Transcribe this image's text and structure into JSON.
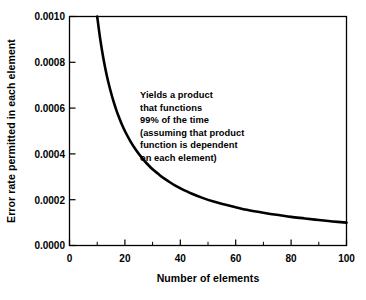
{
  "chart_data": {
    "type": "line",
    "title": "",
    "subtitle": "",
    "xlabel": "Number of elements",
    "ylabel": "Error rate permitted in each element",
    "xlim": [
      0,
      100
    ],
    "ylim": [
      0.0,
      0.001
    ],
    "grid": false,
    "legend": null,
    "x_ticks": [
      0,
      20,
      40,
      60,
      80,
      100
    ],
    "x_tick_labels": [
      "0",
      "20",
      "40",
      "60",
      "80",
      "100"
    ],
    "x_minor_ticks": [
      10,
      30,
      50,
      70,
      90
    ],
    "y_ticks": [
      0.0,
      0.0002,
      0.0004,
      0.0006,
      0.0008,
      0.001
    ],
    "y_tick_labels": [
      "0.0000",
      "0.0002",
      "0.0004",
      "0.0006",
      "0.0008",
      "0.0010"
    ],
    "series": [
      {
        "name": "Error rate per element",
        "relation": "y = 0.01 / x",
        "color": "#000000",
        "line_width": 2.6,
        "x": [
          10,
          11,
          12,
          13,
          14,
          15,
          16,
          17,
          18,
          19,
          20,
          22,
          24,
          26,
          28,
          30,
          32,
          34,
          36,
          38,
          40,
          44,
          48,
          52,
          56,
          60,
          64,
          68,
          72,
          76,
          80,
          85,
          90,
          95,
          100
        ],
        "values": [
          0.001,
          0.000909,
          0.000833,
          0.000769,
          0.000714,
          0.000667,
          0.000625,
          0.000588,
          0.000556,
          0.000526,
          0.0005,
          0.000455,
          0.000417,
          0.000385,
          0.000357,
          0.000333,
          0.000313,
          0.000294,
          0.000278,
          0.000263,
          0.00025,
          0.000227,
          0.000208,
          0.000192,
          0.000179,
          0.000167,
          0.000156,
          0.000147,
          0.000139,
          0.000132,
          0.000125,
          0.000118,
          0.000111,
          0.000105,
          0.0001
        ]
      }
    ],
    "annotations": [
      {
        "name": "curve-explanation",
        "lines": [
          "Yields a product",
          "that functions",
          "99% of the time",
          "(assuming that product",
          "function is dependent",
          "on each element)"
        ]
      }
    ]
  }
}
